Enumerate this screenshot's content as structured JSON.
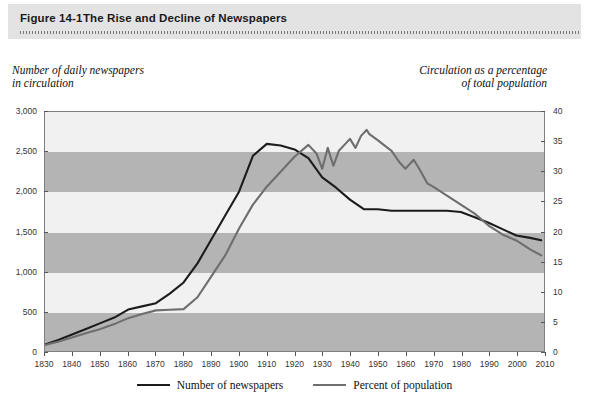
{
  "header": {
    "figure_number": "Figure 14-1",
    "title": "The Rise and Decline of Newspapers"
  },
  "captions": {
    "left_line1": "Number of daily newspapers",
    "left_line2": "in circulation",
    "right_line1": "Circulation as a percentage",
    "right_line2": "of total population"
  },
  "colors": {
    "newspapers_line": "#1c1c1c",
    "percent_line": "#6e6e6e",
    "band_dark": "#b4b4b4",
    "band_light": "#f1f1f1",
    "header_bg": "#e3e3e3",
    "frame": "#808080"
  },
  "chart_data": {
    "type": "line",
    "title": "The Rise and Decline of Newspapers",
    "xlabel": "",
    "ylabel": "Number of daily newspapers in circulation",
    "y2label": "Circulation as a percentage of total population",
    "xlim": [
      1830,
      2010
    ],
    "ylim": [
      0,
      3000
    ],
    "y2lim": [
      0,
      40
    ],
    "grid": "horizontal-bands",
    "legend_position": "bottom-center",
    "xticks": [
      1830,
      1840,
      1850,
      1860,
      1870,
      1880,
      1890,
      1900,
      1910,
      1920,
      1930,
      1940,
      1950,
      1960,
      1970,
      1980,
      1990,
      2000,
      2010
    ],
    "xtick_labels": [
      "1830",
      "1840",
      "1850",
      "1860",
      "1870",
      "1880",
      "1890",
      "1900",
      "1910",
      "1920",
      "1930",
      "1940",
      "1950",
      "1960",
      "1970",
      "1980",
      "1990",
      "2000",
      "2010"
    ],
    "yticks": [
      0,
      500,
      1000,
      1500,
      2000,
      2500,
      3000
    ],
    "ytick_labels": [
      "0",
      "500",
      "1,000",
      "1,500",
      "2,000",
      "2,500",
      "3,000"
    ],
    "y2ticks": [
      0,
      5,
      10,
      15,
      20,
      25,
      30,
      35,
      40
    ],
    "y2tick_labels": [
      "0",
      "5",
      "10",
      "15",
      "20",
      "25",
      "30",
      "35",
      "40"
    ],
    "series": [
      {
        "name": "Number of newspapers",
        "axis": "left",
        "color": "#1c1c1c",
        "x": [
          1830,
          1835,
          1840,
          1845,
          1850,
          1855,
          1860,
          1865,
          1870,
          1875,
          1880,
          1885,
          1890,
          1895,
          1900,
          1905,
          1910,
          1915,
          1920,
          1925,
          1930,
          1935,
          1940,
          1945,
          1950,
          1955,
          1960,
          1965,
          1970,
          1975,
          1980,
          1985,
          1990,
          1995,
          2000,
          2005,
          2009
        ],
        "values": [
          80,
          140,
          210,
          280,
          350,
          420,
          520,
          560,
          600,
          720,
          860,
          1100,
          1400,
          1700,
          2000,
          2450,
          2600,
          2580,
          2530,
          2420,
          2180,
          2050,
          1900,
          1780,
          1780,
          1760,
          1760,
          1760,
          1760,
          1760,
          1745,
          1680,
          1610,
          1530,
          1450,
          1420,
          1390
        ]
      },
      {
        "name": "Percent of population",
        "axis": "right",
        "color": "#6e6e6e",
        "x": [
          1830,
          1835,
          1840,
          1845,
          1850,
          1855,
          1860,
          1865,
          1870,
          1875,
          1880,
          1885,
          1890,
          1895,
          1900,
          1905,
          1910,
          1915,
          1920,
          1925,
          1928,
          1930,
          1932,
          1934,
          1936,
          1938,
          1940,
          1942,
          1944,
          1946,
          1947,
          1950,
          1953,
          1955,
          1958,
          1960,
          1963,
          1965,
          1968,
          1970,
          1975,
          1980,
          1985,
          1990,
          1995,
          2000,
          2005,
          2009
        ],
        "values": [
          1.0,
          1.6,
          2.3,
          3.0,
          3.7,
          4.5,
          5.5,
          6.2,
          6.8,
          6.9,
          7.0,
          9.0,
          12.5,
          16.0,
          20.5,
          24.5,
          27.5,
          30.0,
          32.5,
          34.5,
          33.0,
          30.5,
          34.0,
          31.0,
          33.5,
          34.5,
          35.5,
          34.0,
          36.0,
          37.0,
          36.3,
          35.3,
          34.2,
          33.5,
          31.5,
          30.5,
          32.0,
          30.5,
          28.0,
          27.5,
          26.0,
          24.5,
          23.0,
          21.0,
          19.5,
          18.5,
          17.0,
          16.0
        ]
      }
    ]
  },
  "legend": {
    "items": [
      {
        "label": "Number of newspapers",
        "color": "#1c1c1c"
      },
      {
        "label": "Percent of population",
        "color": "#6e6e6e"
      }
    ]
  }
}
